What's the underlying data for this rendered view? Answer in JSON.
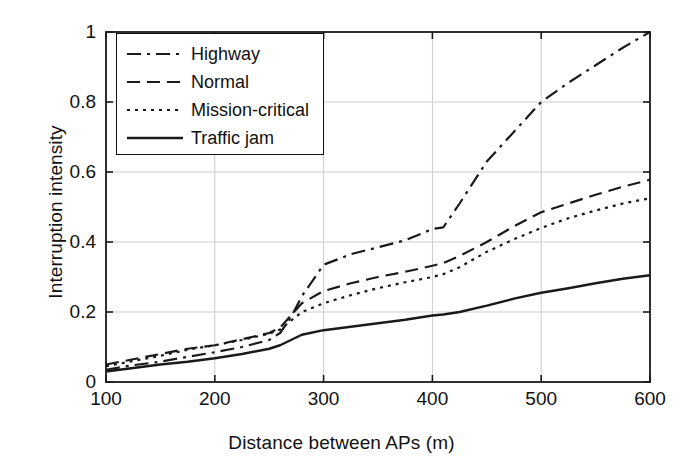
{
  "figure": {
    "background_color": "#ffffff",
    "line_color": "#1a1a1a",
    "grid_color": "#cccccc"
  },
  "chart_data": {
    "type": "line",
    "title": "",
    "xlabel": "Distance between APs (m)",
    "ylabel": "Interruption intensity",
    "xlim": [
      100,
      600
    ],
    "ylim": [
      0,
      1
    ],
    "xticks": [
      100,
      200,
      300,
      400,
      500,
      600
    ],
    "xtick_labels": [
      "100",
      "200",
      "300",
      "400",
      "500",
      "600"
    ],
    "yticks": [
      0,
      0.2,
      0.4,
      0.6,
      0.8,
      1
    ],
    "ytick_labels": [
      "0",
      "0.2",
      "0.4",
      "0.6",
      "0.8",
      "1"
    ],
    "grid": true,
    "legend_position": "upper left",
    "x": [
      100,
      125,
      150,
      175,
      200,
      225,
      250,
      260,
      270,
      280,
      300,
      325,
      350,
      375,
      400,
      410,
      425,
      450,
      475,
      500,
      525,
      550,
      575,
      600
    ],
    "series": [
      {
        "name": "Highway",
        "linestyle": "dashdot",
        "values": [
          0.035,
          0.048,
          0.058,
          0.072,
          0.085,
          0.1,
          0.12,
          0.14,
          0.185,
          0.245,
          0.335,
          0.365,
          0.385,
          0.405,
          0.437,
          0.442,
          0.51,
          0.63,
          0.715,
          0.8,
          0.855,
          0.905,
          0.955,
          1.0
        ]
      },
      {
        "name": "Normal",
        "linestyle": "dashed",
        "values": [
          0.05,
          0.065,
          0.08,
          0.095,
          0.105,
          0.122,
          0.14,
          0.155,
          0.19,
          0.225,
          0.26,
          0.282,
          0.3,
          0.315,
          0.332,
          0.34,
          0.36,
          0.4,
          0.445,
          0.485,
          0.51,
          0.535,
          0.558,
          0.578
        ]
      },
      {
        "name": "Mission-critical",
        "linestyle": "dotted",
        "values": [
          0.045,
          0.06,
          0.075,
          0.092,
          0.105,
          0.12,
          0.138,
          0.15,
          0.175,
          0.2,
          0.225,
          0.248,
          0.268,
          0.285,
          0.3,
          0.308,
          0.328,
          0.372,
          0.408,
          0.44,
          0.468,
          0.49,
          0.51,
          0.525
        ]
      },
      {
        "name": "Traffic jam",
        "linestyle": "solid",
        "values": [
          0.03,
          0.04,
          0.05,
          0.058,
          0.068,
          0.08,
          0.095,
          0.105,
          0.12,
          0.135,
          0.148,
          0.158,
          0.168,
          0.178,
          0.19,
          0.193,
          0.2,
          0.218,
          0.238,
          0.255,
          0.268,
          0.282,
          0.295,
          0.305
        ]
      }
    ]
  },
  "legend": {
    "entries": [
      {
        "label": "Highway",
        "style": "dashdot"
      },
      {
        "label": "Normal",
        "style": "dashed"
      },
      {
        "label": "Mission-critical",
        "style": "dotted"
      },
      {
        "label": "Traffic jam",
        "style": "solid"
      }
    ]
  }
}
